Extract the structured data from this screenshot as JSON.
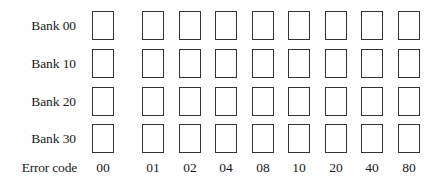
{
  "diagram": {
    "rows": [
      {
        "label": "Bank 00"
      },
      {
        "label": "Bank 10"
      },
      {
        "label": "Bank 20"
      },
      {
        "label": "Bank 30"
      }
    ],
    "columns": [
      {
        "code": "00"
      },
      {
        "code": "01"
      },
      {
        "code": "02"
      },
      {
        "code": "04"
      },
      {
        "code": "08"
      },
      {
        "code": "10"
      },
      {
        "code": "20"
      },
      {
        "code": "40"
      },
      {
        "code": "80"
      }
    ],
    "footer_label": "Error code",
    "colors": {
      "box_border": "#333333",
      "text": "#1a1a1a",
      "background": "#ffffff"
    }
  }
}
